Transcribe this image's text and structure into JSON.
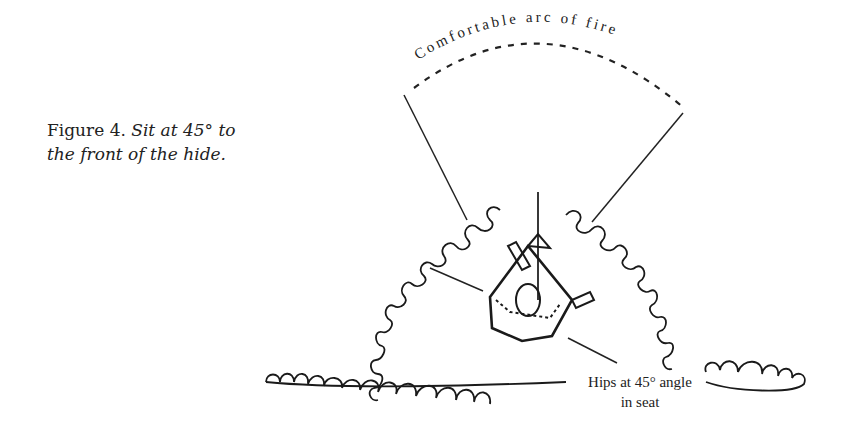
{
  "figure": {
    "number_label": "Figure 4.",
    "caption_line1": "Sit at 45° to",
    "caption_line2": "the front of the hide."
  },
  "annotations": {
    "arc_label": "Comfortable arc of fire",
    "hips_label_line1": "Hips at 45° angle",
    "hips_label_line2": "in seat"
  },
  "illustration": {
    "subject": "top-down view of a seated person in a hide, with rifle pointing forward",
    "elements": [
      "dashed arc of fire",
      "left boundary line",
      "right boundary line",
      "vegetation screen left",
      "vegetation screen right",
      "vegetation screen front",
      "seated figure",
      "hip angle line"
    ],
    "ink_color": "#1a1a1a"
  }
}
